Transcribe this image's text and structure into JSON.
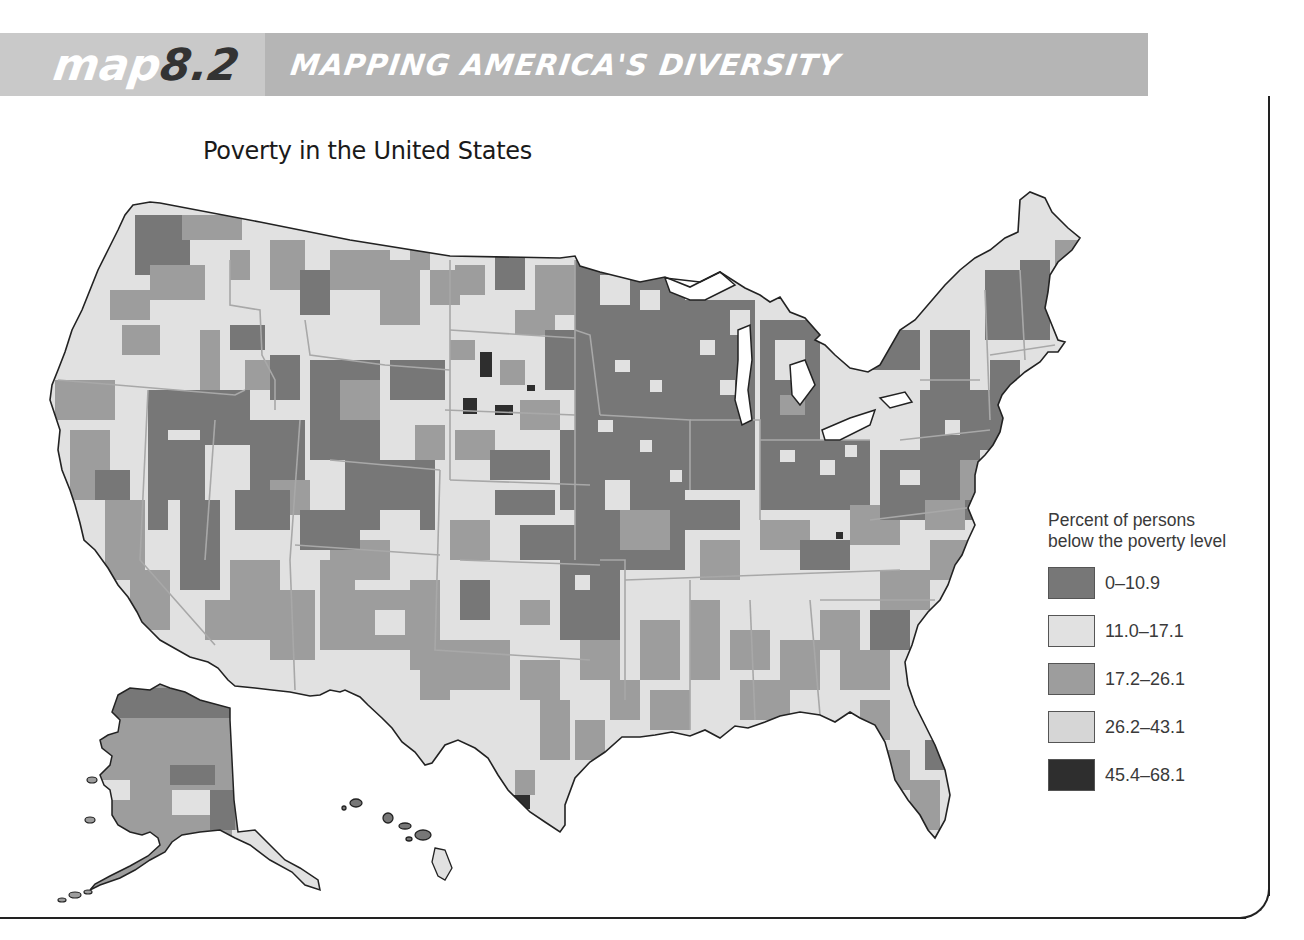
{
  "header": {
    "map_word": "map",
    "map_number": "8.2",
    "series_title": "MAPPING AMERICA'S DIVERSITY"
  },
  "map": {
    "title": "Poverty in the United States",
    "regions_shown": [
      "Contiguous United States",
      "Alaska",
      "Hawaii"
    ],
    "fill_colors": {
      "class_1": "#777777",
      "class_2": "#e1e1e1",
      "class_3": "#9d9d9d",
      "class_4": "#d2d2d2",
      "class_5": "#2e2e2e"
    }
  },
  "legend": {
    "title_line1": "Percent of persons",
    "title_line2": "below the poverty level",
    "items": [
      {
        "label": "0–10.9",
        "color": "#777777"
      },
      {
        "label": "11.0–17.1",
        "color": "#e1e1e1"
      },
      {
        "label": "17.2–26.1",
        "color": "#9d9d9d"
      },
      {
        "label": "26.2–43.1",
        "color": "#d6d6d6"
      },
      {
        "label": "45.4–68.1",
        "color": "#2e2e2e"
      }
    ]
  }
}
